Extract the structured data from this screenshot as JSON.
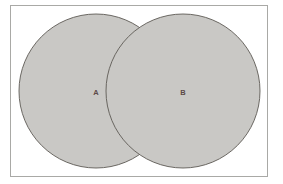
{
  "figure": {
    "kind": "venn-diagram",
    "frame": {
      "border_color": "#a9a9a6",
      "background_color": "#ffffff"
    },
    "background_color": "#ffffff"
  },
  "chart_data": {
    "type": "venn",
    "title": "",
    "subtitle": "",
    "xlabel": "",
    "ylabel": "",
    "grid": false,
    "legend": false,
    "set_count": 2,
    "sets": [
      {
        "label": "A",
        "cx": 96,
        "cy": 91,
        "r": 77,
        "fill": "#c9c8c5",
        "stroke": "#5e5a55",
        "label_x": 96,
        "label_y": 92
      },
      {
        "label": "B",
        "cx": 183,
        "cy": 91,
        "r": 77,
        "fill": "#c9c8c5",
        "stroke": "#5e5a55",
        "label_x": 183,
        "label_y": 92
      }
    ],
    "intersection": {
      "label": "",
      "fill": "#c9c8c5",
      "shaded": true
    },
    "annotations": []
  }
}
